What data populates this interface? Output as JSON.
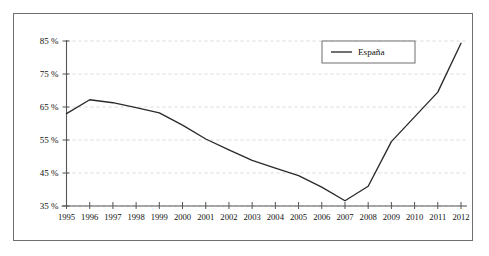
{
  "figure": {
    "background_color": "#ffffff",
    "frame_color": "#6f6f6f",
    "plot_line_color": "#2b2b2b",
    "grid_color": "#d6d6d6",
    "axis_color": "#555555"
  },
  "legend": {
    "position": "top-right-inside",
    "entries": [
      {
        "label": "España",
        "color": "#2b2b2b",
        "marker": "line"
      }
    ]
  },
  "chart_data": {
    "type": "line",
    "title": "",
    "subtitle": "",
    "xlabel": "",
    "ylabel": "",
    "grid": true,
    "grid_axis": "y",
    "legend_position": "top-right-inside",
    "xlim": [
      1995,
      2012
    ],
    "ylim": [
      35,
      85
    ],
    "ytick_values": [
      35,
      45,
      55,
      65,
      75,
      85
    ],
    "ytick_labels": [
      "35 %",
      "45 %",
      "55 %",
      "65 %",
      "75 %",
      "85 %"
    ],
    "xtick_labels": [
      "1995",
      "1996",
      "1997",
      "1998",
      "1999",
      "2000",
      "2001",
      "2002",
      "2003",
      "2004",
      "2005",
      "2006",
      "2007",
      "2008",
      "2009",
      "2010",
      "2011",
      "2012"
    ],
    "x": [
      1995,
      1996,
      1997,
      1998,
      1999,
      2000,
      2001,
      2002,
      2003,
      2004,
      2005,
      2006,
      2007,
      2008,
      2009,
      2010,
      2011,
      2012
    ],
    "series": [
      {
        "name": "España",
        "color": "#2b2b2b",
        "values": [
          63.0,
          67.2,
          66.3,
          64.8,
          63.2,
          59.5,
          55.3,
          52.0,
          48.8,
          46.5,
          44.2,
          40.7,
          36.6,
          41.0,
          54.5,
          62.0,
          69.5,
          84.3
        ]
      }
    ],
    "annotations": []
  }
}
